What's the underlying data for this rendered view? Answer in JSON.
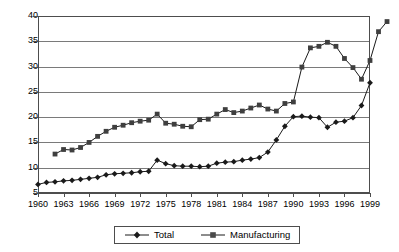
{
  "chart_data": {
    "type": "line",
    "title": "",
    "subtitle": "",
    "xlabel": "",
    "ylabel": "",
    "xlim": [
      1960,
      1999
    ],
    "ylim": [
      5,
      40
    ],
    "ytick_step": 5,
    "xtick_step": 3,
    "grid": "horizontal",
    "legend_position": "bottom-center",
    "x": [
      1960,
      1961,
      1962,
      1963,
      1964,
      1965,
      1966,
      1967,
      1968,
      1969,
      1970,
      1971,
      1972,
      1973,
      1974,
      1975,
      1976,
      1977,
      1978,
      1979,
      1980,
      1981,
      1982,
      1983,
      1984,
      1985,
      1986,
      1987,
      1988,
      1989,
      1990,
      1991,
      1992,
      1993,
      1994,
      1995,
      1996,
      1997,
      1998,
      1999
    ],
    "ytick_labels": [
      "5",
      "10",
      "15",
      "20",
      "25",
      "30",
      "35",
      "40"
    ],
    "xtick_labels": [
      "1960",
      "1963",
      "1966",
      "1969",
      "1972",
      "1975",
      "1978",
      "1981",
      "1984",
      "1987",
      "1990",
      "1993",
      "1996",
      "1999"
    ],
    "series": [
      {
        "name": "Total",
        "marker": "diamond",
        "color": "#1a1a1a",
        "start_year": 1960,
        "values": [
          6.7,
          7.1,
          7.2,
          7.4,
          7.5,
          7.7,
          7.9,
          8.1,
          8.6,
          8.8,
          8.9,
          9.0,
          9.2,
          9.3,
          11.5,
          10.8,
          10.4,
          10.3,
          10.3,
          10.2,
          10.3,
          10.9,
          11.1,
          11.2,
          11.5,
          11.7,
          12.0,
          13.1,
          15.5,
          18.2,
          20.1,
          20.2,
          20.0,
          19.9,
          18.0,
          19.0,
          19.2,
          19.9,
          22.3,
          26.8
        ]
      },
      {
        "name": "Manufacturing",
        "marker": "square",
        "color": "#1a1a1a",
        "start_year": 1962,
        "values": [
          12.7,
          13.6,
          13.5,
          14.0,
          15.0,
          16.2,
          17.2,
          18.0,
          18.4,
          18.9,
          19.2,
          19.4,
          20.6,
          18.8,
          18.6,
          18.2,
          18.1,
          19.5,
          19.6,
          20.6,
          21.5,
          20.9,
          21.2,
          21.8,
          22.4,
          21.6,
          21.2,
          22.7,
          23.0,
          29.9,
          33.7,
          34.0,
          34.8,
          34.0,
          31.6,
          29.8,
          27.5,
          31.2,
          36.9,
          38.9
        ]
      }
    ]
  },
  "legend": {
    "entries": [
      {
        "label": "Total",
        "marker": "diamond"
      },
      {
        "label": "Manufacturing",
        "marker": "square"
      }
    ]
  }
}
